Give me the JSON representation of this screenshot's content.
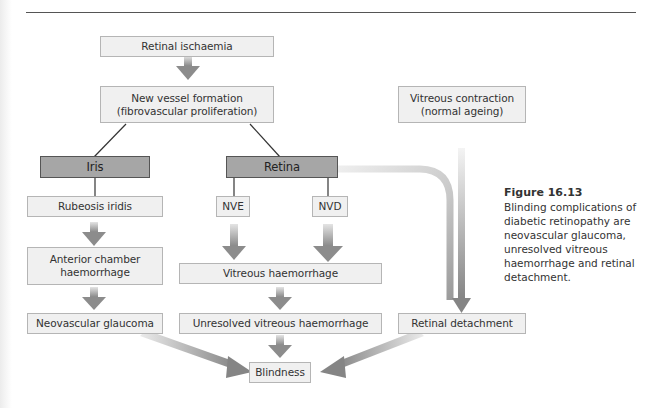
{
  "figure": {
    "number": "Figure 16.13",
    "caption": "Blinding complications of diabetic retinopathy are neovascular glaucoma, unresolved vitreous haemorrhage and retinal detachment."
  },
  "nodes": {
    "retinal_ischaemia": "Retinal ischaemia",
    "new_vessel_formation": "New vessel formation\n(fibrovascular proliferation)",
    "vitreous_contraction": "Vitreous contraction\n(normal ageing)",
    "iris": "Iris",
    "retina": "Retina",
    "rubeosis_iridis": "Rubeosis iridis",
    "nve": "NVE",
    "nvd": "NVD",
    "anterior_chamber_haemorrhage": "Anterior chamber\nhaemorrhage",
    "vitreous_haemorrhage": "Vitreous haemorrhage",
    "neovascular_glaucoma": "Neovascular glaucoma",
    "unresolved_vitreous_haemorrhage": "Unresolved vitreous haemorrhage",
    "retinal_detachment": "Retinal detachment",
    "blindness": "Blindness"
  },
  "edges": [
    {
      "from": "Retinal ischaemia",
      "to": "New vessel formation",
      "style": "block-arrow"
    },
    {
      "from": "New vessel formation",
      "to": "Iris",
      "style": "line"
    },
    {
      "from": "New vessel formation",
      "to": "Retina",
      "style": "line"
    },
    {
      "from": "Iris",
      "to": "Rubeosis iridis",
      "style": "line"
    },
    {
      "from": "Retina",
      "to": "NVE",
      "style": "line"
    },
    {
      "from": "Retina",
      "to": "NVD",
      "style": "line"
    },
    {
      "from": "Retina",
      "to": "Retinal detachment",
      "style": "curved-arrow"
    },
    {
      "from": "Vitreous contraction",
      "to": "Retinal detachment",
      "style": "arrow"
    },
    {
      "from": "Rubeosis iridis",
      "to": "Anterior chamber haemorrhage",
      "style": "block-arrow"
    },
    {
      "from": "Anterior chamber haemorrhage",
      "to": "Neovascular glaucoma",
      "style": "block-arrow"
    },
    {
      "from": "NVE",
      "to": "Vitreous haemorrhage",
      "style": "block-arrow"
    },
    {
      "from": "NVD",
      "to": "Vitreous haemorrhage",
      "style": "block-arrow"
    },
    {
      "from": "Vitreous haemorrhage",
      "to": "Unresolved vitreous haemorrhage",
      "style": "block-arrow"
    },
    {
      "from": "Neovascular glaucoma",
      "to": "Blindness",
      "style": "diagonal-arrow"
    },
    {
      "from": "Unresolved vitreous haemorrhage",
      "to": "Blindness",
      "style": "block-arrow"
    },
    {
      "from": "Retinal detachment",
      "to": "Blindness",
      "style": "diagonal-arrow"
    }
  ],
  "colors": {
    "box_fill": "#f0f0f0",
    "box_border": "#b5b5b5",
    "dark_box_fill": "#a6a6a6",
    "arrow": "#8c8c8c"
  }
}
